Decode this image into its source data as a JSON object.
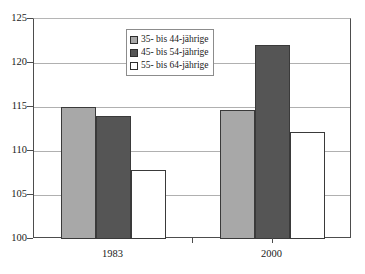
{
  "chart_data": {
    "type": "bar",
    "title": "",
    "subtitle": "",
    "xlabel": "",
    "ylabel": "",
    "categories": [
      "1983",
      "2000"
    ],
    "series": [
      {
        "name": "35- bis 44-jährige",
        "values": [
          115.0,
          114.7
        ],
        "color": "#a8a8a8"
      },
      {
        "name": "45- bis 54-jährige",
        "values": [
          114.0,
          122.0
        ],
        "color": "#555555"
      },
      {
        "name": "55- bis 64-jährige",
        "values": [
          107.8,
          112.2
        ],
        "color": "#ffffff"
      }
    ],
    "ylim": [
      100,
      125
    ],
    "yticks": [
      100,
      105,
      110,
      115,
      120,
      125
    ],
    "ytick_labels": [
      "100",
      "105",
      "110",
      "115",
      "120",
      "125"
    ],
    "grid": "horizontal",
    "legend_position": "top-center-inside"
  },
  "colors": {
    "series_1": "#a8a8a8",
    "series_2": "#555555",
    "series_3": "#ffffff",
    "bar_border": "#3a3a3a",
    "gridline": "#b0b0b0",
    "axis": "#4d4d4d",
    "text": "#1a1a1a",
    "legend_border": "#8c8c8c",
    "background": "#ffffff"
  }
}
